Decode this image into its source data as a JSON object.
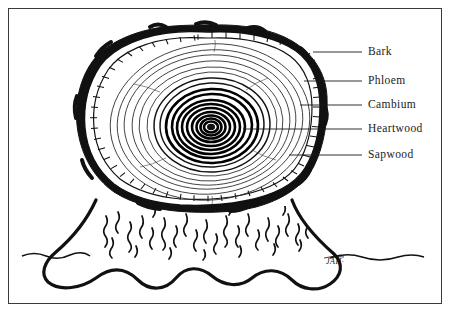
{
  "figure": {
    "signature": "JAH·",
    "ink_color": "#111111",
    "paper_color": "#ffffff",
    "border_color": "#3a3a3a"
  },
  "labels": [
    {
      "id": "bark",
      "text": "Bark",
      "x": 368,
      "y": 57,
      "leader_from_x": 313,
      "leader_to_x": 362,
      "leader_y": 52
    },
    {
      "id": "phloem",
      "text": "Phloem",
      "x": 368,
      "y": 86,
      "leader_from_x": 304,
      "leader_to_x": 362,
      "leader_y": 81
    },
    {
      "id": "cambium",
      "text": "Cambium",
      "x": 368,
      "y": 110,
      "leader_from_x": 300,
      "leader_to_x": 362,
      "leader_y": 105
    },
    {
      "id": "heartwood",
      "text": "Heartwood",
      "x": 368,
      "y": 134,
      "leader_from_x": 243,
      "leader_to_x": 362,
      "leader_y": 129
    },
    {
      "id": "sapwood",
      "text": "Sapwood",
      "x": 368,
      "y": 160,
      "leader_from_x": 289,
      "leader_to_x": 362,
      "leader_y": 155
    }
  ],
  "anatomy": {
    "ring_count_visible": 22,
    "center": {
      "x": 211,
      "y": 127
    },
    "cross_section_bounds": {
      "left": 62,
      "top": 25,
      "right": 326,
      "bottom": 212
    },
    "ground_line_y": 255
  }
}
